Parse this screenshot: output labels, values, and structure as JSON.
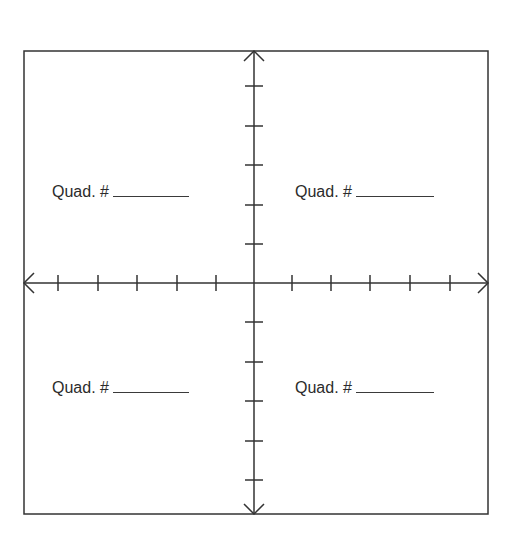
{
  "diagram": {
    "type": "coordinate-plane",
    "frame": {
      "left": 24,
      "top": 51,
      "right": 488,
      "bottom": 514
    },
    "origin": {
      "x": 254,
      "y": 283
    },
    "x_ticks": [
      58,
      98,
      137,
      177,
      216,
      292,
      331,
      370,
      410,
      450
    ],
    "y_ticks": [
      86,
      126,
      165,
      205,
      244,
      322,
      362,
      401,
      441,
      480
    ],
    "stroke_color": "#333333"
  },
  "quadrants": [
    {
      "position": "top-left",
      "prefix": "Quad. #",
      "answer": ""
    },
    {
      "position": "top-right",
      "prefix": "Quad. #",
      "answer": ""
    },
    {
      "position": "bottom-left",
      "prefix": "Quad. #",
      "answer": ""
    },
    {
      "position": "bottom-right",
      "prefix": "Quad. #",
      "answer": ""
    }
  ]
}
